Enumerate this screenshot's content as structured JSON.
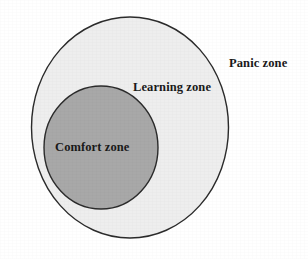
{
  "figure": {
    "name": "comfort-learning-panic-zone-diagram",
    "type": "concentric-circles-venn",
    "background_color": "#ffffff",
    "width": 308,
    "height": 259
  },
  "zones": [
    {
      "id": "panic",
      "label": "Panic zone",
      "shape": "ellipse",
      "fill_color": "#eeeeee",
      "stroke_color": "#2b2b2b",
      "stroke_width": 1.4,
      "center_x": 130,
      "center_y": 127.5,
      "radius_x": 98.5,
      "radius_y": 110.5,
      "label_x": 229,
      "label_y": 57,
      "label_placement": "outside-right"
    },
    {
      "id": "learning",
      "label": "Learning zone",
      "shape": "ring",
      "fill_color": "#eeeeee",
      "stroke_color": "#2b2b2b",
      "label_x": 133,
      "label_y": 81,
      "label_placement": "inside-outer-ring"
    },
    {
      "id": "comfort",
      "label": "Comfort zone",
      "shape": "ellipse",
      "fill_color": "#a8a8a8",
      "stroke_color": "#2b2b2b",
      "stroke_width": 1.4,
      "center_x": 101,
      "center_y": 147.5,
      "radius_x": 57,
      "radius_y": 61.5,
      "label_x": 55,
      "label_y": 141,
      "label_placement": "inside-inner-circle"
    }
  ],
  "labels": {
    "panic": "Panic zone",
    "learning": "Learning zone",
    "comfort": "Comfort zone"
  },
  "colors": {
    "background": "#ffffff",
    "outer_fill": "#eeeeee",
    "inner_fill": "#a8a8a8",
    "stroke": "#2b2b2b",
    "text": "#1a1a1a"
  }
}
